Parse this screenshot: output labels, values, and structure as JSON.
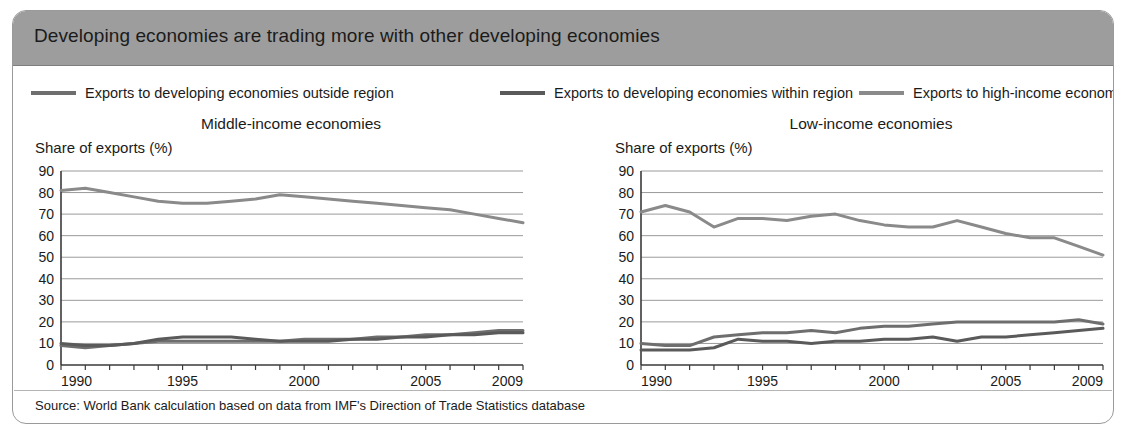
{
  "figure": {
    "title": "Developing economies are trading more with other developing economies",
    "source": "Source: World Bank calculation based on data from IMF's Direction of Trade Statistics database",
    "title_bar_color": "#9d9d9d",
    "border_color": "#9a9a9a"
  },
  "legend": {
    "items": [
      {
        "label": "Exports to developing economies outside region",
        "color": "#6e6e6e"
      },
      {
        "label": "Exports to developing economies within region",
        "color": "#5a5a5a"
      },
      {
        "label": "Exports to high-income economies",
        "color": "#8a8a8a"
      }
    ]
  },
  "chart_data": [
    {
      "type": "line",
      "title": "Middle-income economies",
      "xlabel": "",
      "ylabel": "Share of exports (%)",
      "ylim": [
        0,
        90
      ],
      "yticks": [
        0,
        10,
        20,
        30,
        40,
        50,
        60,
        70,
        80,
        90
      ],
      "xlim": [
        1990,
        2009
      ],
      "xticks": [
        1990,
        1995,
        2000,
        2005,
        2009
      ],
      "x": [
        1990,
        1991,
        1992,
        1993,
        1994,
        1995,
        1996,
        1997,
        1998,
        1999,
        2000,
        2001,
        2002,
        2003,
        2004,
        2005,
        2006,
        2007,
        2008,
        2009
      ],
      "grid": true,
      "legend_position": "top",
      "series": [
        {
          "name": "Exports to high-income economies",
          "color": "#8a8a8a",
          "values": [
            81,
            82,
            80,
            78,
            76,
            75,
            75,
            76,
            77,
            79,
            78,
            77,
            76,
            75,
            74,
            73,
            72,
            70,
            68,
            66
          ]
        },
        {
          "name": "Exports to developing economies outside region",
          "color": "#6e6e6e",
          "values": [
            9,
            8,
            9,
            10,
            11,
            11,
            11,
            11,
            11,
            11,
            12,
            12,
            12,
            13,
            13,
            14,
            14,
            15,
            16,
            16
          ]
        },
        {
          "name": "Exports to developing economies within region",
          "color": "#5a5a5a",
          "values": [
            10,
            9,
            9,
            10,
            12,
            13,
            13,
            13,
            12,
            11,
            11,
            11,
            12,
            12,
            13,
            13,
            14,
            14,
            15,
            15
          ]
        }
      ]
    },
    {
      "type": "line",
      "title": "Low-income economies",
      "xlabel": "",
      "ylabel": "Share of exports (%)",
      "ylim": [
        0,
        90
      ],
      "yticks": [
        0,
        10,
        20,
        30,
        40,
        50,
        60,
        70,
        80,
        90
      ],
      "xlim": [
        1990,
        2009
      ],
      "xticks": [
        1990,
        1995,
        2000,
        2005,
        2009
      ],
      "x": [
        1990,
        1991,
        1992,
        1993,
        1994,
        1995,
        1996,
        1997,
        1998,
        1999,
        2000,
        2001,
        2002,
        2003,
        2004,
        2005,
        2006,
        2007,
        2008,
        2009
      ],
      "grid": true,
      "legend_position": "top",
      "series": [
        {
          "name": "Exports to high-income economies",
          "color": "#8a8a8a",
          "values": [
            71,
            74,
            71,
            64,
            68,
            68,
            67,
            69,
            70,
            67,
            65,
            64,
            64,
            67,
            64,
            61,
            59,
            59,
            55,
            51
          ]
        },
        {
          "name": "Exports to developing economies outside region",
          "color": "#6e6e6e",
          "values": [
            10,
            9,
            9,
            13,
            14,
            15,
            15,
            16,
            15,
            17,
            18,
            18,
            19,
            20,
            20,
            20,
            20,
            20,
            21,
            19
          ]
        },
        {
          "name": "Exports to developing economies within region",
          "color": "#5a5a5a",
          "values": [
            7,
            7,
            7,
            8,
            12,
            11,
            11,
            10,
            11,
            11,
            12,
            12,
            13,
            11,
            13,
            13,
            14,
            15,
            16,
            17
          ]
        }
      ]
    }
  ]
}
